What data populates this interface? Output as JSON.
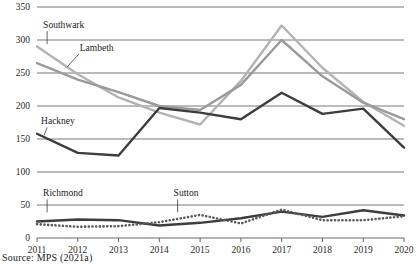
{
  "source_note": "Source: MPS (2021a)",
  "chart_data": {
    "type": "line",
    "title": "",
    "xlabel": "",
    "ylabel": "",
    "grid": true,
    "legend_position": "inline-labels",
    "x": [
      2011,
      2012,
      2013,
      2014,
      2015,
      2016,
      2017,
      2018,
      2019,
      2020
    ],
    "xtick_labels": [
      "2011",
      "2012",
      "2013",
      "2014",
      "2015",
      "2016",
      "2017",
      "2018",
      "2019",
      "2020"
    ],
    "ytick_labels": [
      "0",
      "50",
      "100",
      "150",
      "200",
      "250",
      "300",
      "350"
    ],
    "yticks": [
      0,
      50,
      100,
      150,
      200,
      250,
      300,
      350
    ],
    "ylim": [
      0,
      350
    ],
    "xlim": [
      2011,
      2020
    ],
    "series": [
      {
        "name": "Southwark",
        "color": "#b3b3b3",
        "style": "solid",
        "label_x": 2011.15,
        "label_y": 318,
        "values": [
          290,
          248,
          213,
          190,
          172,
          238,
          322,
          258,
          206,
          170
        ]
      },
      {
        "name": "Lambeth",
        "color": "#9a9a9a",
        "style": "solid",
        "label_x": 2012.05,
        "label_y": 283,
        "values": [
          265,
          240,
          221,
          200,
          194,
          232,
          300,
          245,
          205,
          180
        ]
      },
      {
        "name": "Hackney",
        "color": "#3d3d3d",
        "style": "solid",
        "label_x": 2011.1,
        "label_y": 172,
        "values": [
          158,
          129,
          125,
          197,
          190,
          180,
          220,
          188,
          196,
          137
        ]
      },
      {
        "name": "Richmond",
        "color": "#3d3d3d",
        "style": "solid",
        "label_x": 2011.15,
        "label_y": 63,
        "values": [
          25,
          28,
          27,
          19,
          23,
          30,
          40,
          32,
          42,
          34
        ]
      },
      {
        "name": "Sutton",
        "color": "#5a5a5a",
        "style": "dotted",
        "label_x": 2014.35,
        "label_y": 63,
        "values": [
          21,
          17,
          18,
          24,
          35,
          22,
          43,
          27,
          27,
          33
        ]
      }
    ]
  }
}
